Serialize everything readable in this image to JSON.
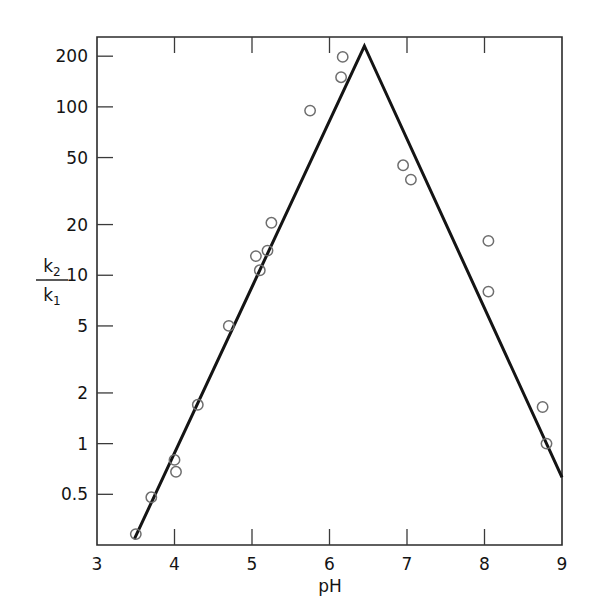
{
  "chart_data": {
    "type": "scatter",
    "title": "",
    "subtitle": "",
    "xlabel": "pH",
    "ylabel": "k2/k1",
    "ylabel_numerator": "k",
    "ylabel_numerator_sub": "2",
    "ylabel_denominator": "k",
    "ylabel_denominator_sub": "1",
    "xlim": [
      3,
      9
    ],
    "ylim": [
      0.25,
      260
    ],
    "yscale": "log",
    "xscale": "linear",
    "grid": false,
    "legend": null,
    "legend_position": "none",
    "xticks": [
      3,
      4,
      5,
      6,
      7,
      8,
      9
    ],
    "xticklabels": [
      "3",
      "4",
      "5",
      "6",
      "7",
      "8",
      "9"
    ],
    "yticks": [
      0.5,
      1,
      2,
      5,
      10,
      20,
      50,
      100,
      200
    ],
    "yticklabels": [
      "0.5",
      "1",
      "2",
      "5",
      "10",
      "20",
      "50",
      "100",
      "200"
    ],
    "series": [
      {
        "name": "measured k2/k1",
        "marker": "open-circle",
        "marker_color": "#6e6e6e",
        "points": [
          {
            "x": 3.5,
            "y": 0.29
          },
          {
            "x": 3.7,
            "y": 0.48
          },
          {
            "x": 4.0,
            "y": 0.8
          },
          {
            "x": 4.02,
            "y": 0.68
          },
          {
            "x": 4.3,
            "y": 1.7
          },
          {
            "x": 4.7,
            "y": 5.0
          },
          {
            "x": 5.05,
            "y": 13.0
          },
          {
            "x": 5.1,
            "y": 10.7
          },
          {
            "x": 5.2,
            "y": 14.0
          },
          {
            "x": 5.25,
            "y": 20.5
          },
          {
            "x": 5.75,
            "y": 95.0
          },
          {
            "x": 6.15,
            "y": 150.0
          },
          {
            "x": 6.17,
            "y": 198.0
          },
          {
            "x": 6.95,
            "y": 45.0
          },
          {
            "x": 7.05,
            "y": 37.0
          },
          {
            "x": 8.05,
            "y": 16.0
          },
          {
            "x": 8.05,
            "y": 8.0
          },
          {
            "x": 8.75,
            "y": 1.65
          },
          {
            "x": 8.8,
            "y": 1.0
          }
        ]
      },
      {
        "name": "fitted bell curve",
        "marker": "none",
        "line_color": "#141414",
        "points": [
          {
            "x": 3.48,
            "y": 0.27
          },
          {
            "x": 6.45,
            "y": 230.0
          },
          {
            "x": 9.0,
            "y": 0.63
          }
        ]
      }
    ]
  },
  "figure": {
    "background_color": "#ffffff",
    "axis_color": "#2b2b2b",
    "marker_color": "#6e6e6e",
    "line_color": "#141414"
  }
}
